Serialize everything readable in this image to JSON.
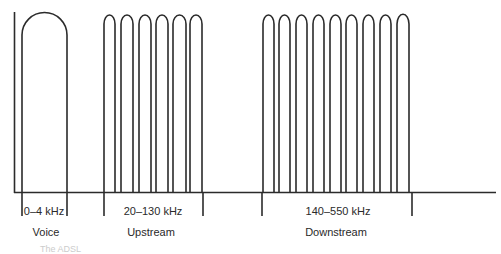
{
  "diagram": {
    "bands": [
      {
        "name": "voice",
        "range_label": "0–4 kHz",
        "label": "Voice",
        "arches": 1
      },
      {
        "name": "upstream",
        "range_label": "20–130 kHz",
        "label": "Upstream",
        "arches": 6
      },
      {
        "name": "downstream",
        "range_label": "140–550 kHz",
        "label": "Downstream",
        "arches": 9
      }
    ],
    "caption": "The ADSL"
  }
}
